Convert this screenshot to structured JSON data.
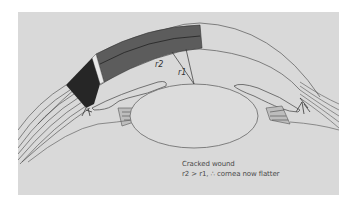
{
  "figure": {
    "title": "Cracked wound",
    "subtitle": "r2 > r1, ∴ cornea now flatter",
    "labels": {
      "r1": "r1",
      "r2": "r2"
    },
    "colors": {
      "page_background": "#ffffff",
      "panel_background": "#d9d9d9",
      "line": "#555555",
      "cornea_shading": "#5a5a5a",
      "wound_dark": "#2a2a2a"
    },
    "structures": [
      "cornea-wound-segment",
      "cracked-wound-gap",
      "limbus-dark-region",
      "sclera-fibers-left",
      "sclera-fibers-right",
      "iris-left",
      "iris-right",
      "ciliary-body-left",
      "ciliary-body-right",
      "lens",
      "radius-r1",
      "radius-r2"
    ]
  }
}
